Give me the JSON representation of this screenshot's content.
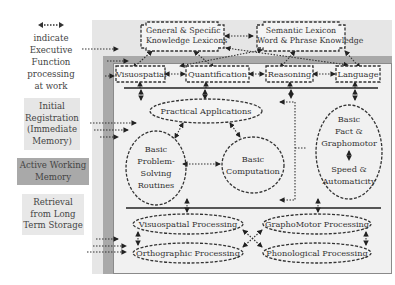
{
  "legend": {
    "arrow_label": "indicate Executive Function processing at work",
    "arrow_lines": [
      "indicate",
      "Executive",
      "Function",
      "processing",
      "at work"
    ],
    "initial_registration_lines": [
      "Initial",
      "Registration",
      "(Immediate",
      "Memory)"
    ],
    "active_working_memory_lines": [
      "Active Working",
      "Memory"
    ],
    "retrieval_lines": [
      "Retrieval",
      "from Long",
      "Term Storage"
    ]
  },
  "lexicons": {
    "general": [
      "General & Specific",
      "Knowledge Lexicons"
    ],
    "semantic": [
      "Semantic Lexicon",
      "Word & Phrase Knowledge"
    ]
  },
  "domains": [
    "Visuospatial",
    "Quantification",
    "Reasoning",
    "Language"
  ],
  "center": {
    "practical": "Practical Applications",
    "problem_solving": [
      "Basic",
      "Problem-",
      "Solving",
      "Routines"
    ],
    "computation": [
      "Basic",
      "Computation"
    ],
    "fact_graphomotor": [
      "Basic",
      "Fact &",
      "Graphomotor"
    ],
    "speed": [
      "Speed &",
      "Automaticity"
    ]
  },
  "processing": {
    "visuospatial": "Visuospatial Processing",
    "graphomotor": "GraphoMotor Processing",
    "orthographic": "Orthographic Processing",
    "phonological": "Phonological Processing"
  },
  "colors": {
    "outer_band": "#e6e6e6",
    "working_memory_band": "#a9a9a9",
    "inner_panel": "#f1f1f1",
    "retrieval_box": "#e8e8e8",
    "line": "#333333"
  }
}
